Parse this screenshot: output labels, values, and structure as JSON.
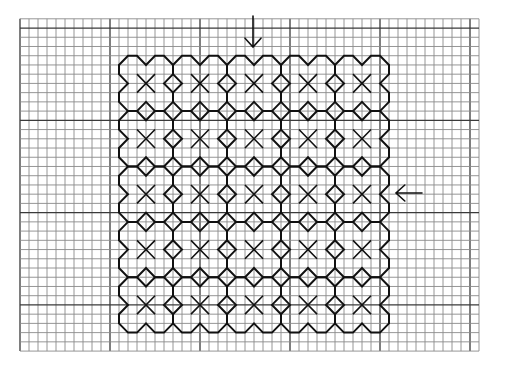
{
  "diagram": {
    "type": "blackwork-stitch-chart",
    "canvas": {
      "width": 507,
      "height": 366,
      "background": "#ffffff"
    },
    "grid": {
      "x0": 20,
      "y0": 18.8,
      "cell_w": 9.0,
      "cell_h": 9.23,
      "cols": 51,
      "rows": 36,
      "major_every": 10,
      "major_col_offset": 0,
      "major_row_offset": 1,
      "minor_color": "#8a8a8a",
      "major_color": "#3a3a3a"
    },
    "pattern": {
      "origin_col": 11,
      "origin_row": 4,
      "tile_cells": 6,
      "tiles_x": 5,
      "tiles_y": 5,
      "outline_color": "#111111",
      "tile_outline_cells": [
        [
          1,
          0
        ],
        [
          2,
          0
        ],
        [
          3,
          1
        ],
        [
          4,
          0
        ],
        [
          5,
          0
        ],
        [
          6,
          1
        ],
        [
          6,
          2
        ],
        [
          5,
          3
        ],
        [
          6,
          4
        ],
        [
          6,
          5
        ],
        [
          5,
          6
        ],
        [
          4,
          6
        ],
        [
          3,
          5
        ],
        [
          2,
          6
        ],
        [
          1,
          6
        ],
        [
          0,
          5
        ],
        [
          0,
          4
        ],
        [
          1,
          3
        ],
        [
          0,
          2
        ],
        [
          0,
          1
        ]
      ],
      "center_motif": "x-cross",
      "x_half_size_cells": 1
    },
    "arrows": [
      {
        "name": "down-arrow",
        "direction": "down",
        "x": 253,
        "y1": 16,
        "y2": 47,
        "head": 8
      },
      {
        "name": "left-arrow",
        "direction": "left",
        "y": 193,
        "x1": 422,
        "x2": 396,
        "head": 8
      }
    ]
  }
}
